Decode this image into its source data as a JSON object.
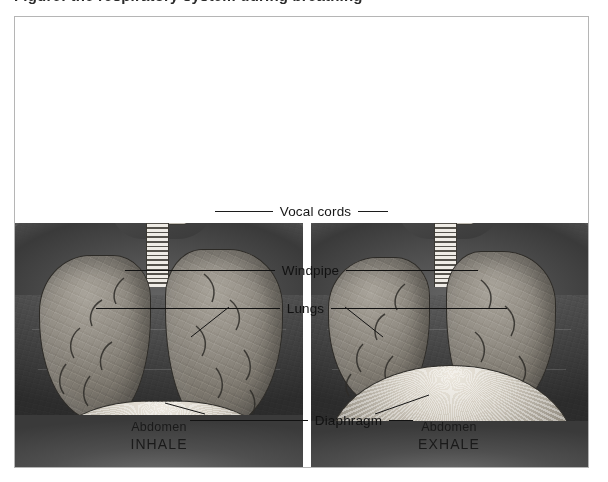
{
  "figure": {
    "top_caption_sliver": "Figure: the respiratory system during breathing",
    "border_color": "#b5b5b5",
    "background_color": "#ffffff",
    "illustration_style": "grayscale anatomical airbrush illustration"
  },
  "callouts": [
    {
      "id": "vocal-cords",
      "label": "Vocal cords",
      "points_to": "larynx in the throat of both figures"
    },
    {
      "id": "windpipe",
      "label": "Windpipe",
      "points_to": "trachea below the larynx in both figures"
    },
    {
      "id": "lungs",
      "label": "Lungs",
      "points_to": "left and right lungs in both figures"
    },
    {
      "id": "diaphragm",
      "label": "Diaphragm",
      "points_to": "muscular sheet beneath the lungs in both figures"
    }
  ],
  "panels": [
    {
      "id": "inhale",
      "region_label": "Abdomen",
      "state_label": "INHALE",
      "description": "Lungs expanded and filled with air; diaphragm contracted, flattened and pulled downward."
    },
    {
      "id": "exhale",
      "region_label": "Abdomen",
      "state_label": "EXHALE",
      "description": "Lungs reduced in volume; diaphragm relaxed and domed upward into the chest."
    }
  ],
  "colors": {
    "ink": "#161616",
    "leader_line": "#1c1c1c",
    "lung_tone": "#938e85",
    "diaphragm_highlight": "#f0ece4",
    "torso_tone": "#4b4b4b",
    "page": "#ffffff"
  }
}
